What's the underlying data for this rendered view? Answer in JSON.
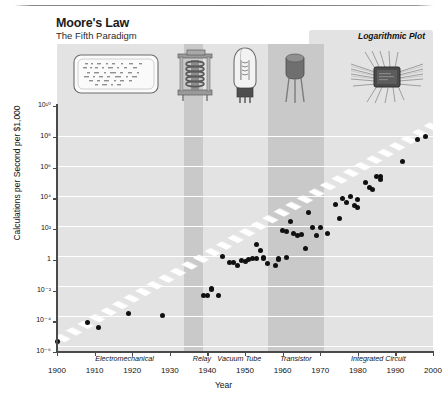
{
  "figure": {
    "title": "Moore's Law",
    "subtitle": "The Fifth Paradigm",
    "plot_type_label": "Logarithmic Plot"
  },
  "artwork": [
    {
      "name": "punch-card-illustration",
      "era": "Electromechanical"
    },
    {
      "name": "relay-illustration",
      "era": "Relay"
    },
    {
      "name": "vacuum-tube-illustration",
      "era": "Vacuum Tube"
    },
    {
      "name": "transistor-illustration",
      "era": "Transistor"
    },
    {
      "name": "integrated-circuit-illustration",
      "era": "Integrated Circuit"
    }
  ],
  "chart_data": {
    "type": "scatter",
    "title": "Moore's Law",
    "subtitle": "The Fifth Paradigm",
    "annotation": "Logarithmic Plot",
    "xlabel": "Year",
    "ylabel": "Calculations per Second per $1,000",
    "xlim": [
      1900,
      2000
    ],
    "ylim": [
      -6,
      10
    ],
    "yscale": "log10",
    "grid": true,
    "legend": "none",
    "xticks": [
      1900,
      1910,
      1920,
      1930,
      1940,
      1950,
      1960,
      1970,
      1980,
      1990,
      2000
    ],
    "xticklabels": [
      "1900",
      "1910",
      "1920",
      "1930",
      "1940",
      "1950",
      "1960",
      "1970",
      "1980",
      "1990",
      "2000"
    ],
    "yticks": [
      -6,
      -4,
      -2,
      0,
      2,
      4,
      6,
      8,
      10
    ],
    "yticklabels": [
      "10⁻⁶",
      "10⁻⁴",
      "10⁻²",
      "1",
      "10²",
      "10⁴",
      "10⁶",
      "10⁸",
      "10¹⁰"
    ],
    "eras": [
      {
        "label": "Electromechanical",
        "start": 1900,
        "end": 1936,
        "shaded": false
      },
      {
        "label": "Relay",
        "start": 1936,
        "end": 1941,
        "shaded": true
      },
      {
        "label": "Vacuum Tube",
        "start": 1941,
        "end": 1956,
        "shaded": false
      },
      {
        "label": "Transistor",
        "start": 1956,
        "end": 1971,
        "shaded": true
      },
      {
        "label": "Integrated Circuit",
        "start": 1971,
        "end": 2000,
        "shaded": false
      }
    ],
    "trendline": {
      "type": "exponential-fit",
      "style": "dashed-white-band",
      "x": [
        1900,
        2000
      ],
      "log10y": [
        -5.3,
        8.7
      ]
    },
    "points": [
      {
        "x": 1900,
        "log10y": -5.3
      },
      {
        "x": 1908,
        "log10y": -4.1
      },
      {
        "x": 1911,
        "log10y": -4.4
      },
      {
        "x": 1919,
        "log10y": -3.5
      },
      {
        "x": 1928,
        "log10y": -3.6
      },
      {
        "x": 1939,
        "log10y": -2.3
      },
      {
        "x": 1940,
        "log10y": -2.35
      },
      {
        "x": 1941,
        "log10y": -1.85
      },
      {
        "x": 1941,
        "log10y": -1.95
      },
      {
        "x": 1943,
        "log10y": -2.3
      },
      {
        "x": 1944,
        "log10y": 0.2
      },
      {
        "x": 1946,
        "log10y": -0.2
      },
      {
        "x": 1947,
        "log10y": -0.2
      },
      {
        "x": 1948,
        "log10y": -0.4
      },
      {
        "x": 1949,
        "log10y": -0.05
      },
      {
        "x": 1950,
        "log10y": -0.1
      },
      {
        "x": 1951,
        "log10y": 0.0
      },
      {
        "x": 1952,
        "log10y": 0.1
      },
      {
        "x": 1953,
        "log10y": 0.05
      },
      {
        "x": 1953,
        "log10y": 1.0
      },
      {
        "x": 1954,
        "log10y": 0.6
      },
      {
        "x": 1955,
        "log10y": 0.15
      },
      {
        "x": 1955,
        "log10y": 0.1
      },
      {
        "x": 1956,
        "log10y": -0.25
      },
      {
        "x": 1958,
        "log10y": -0.35
      },
      {
        "x": 1959,
        "log10y": 0.05
      },
      {
        "x": 1959,
        "log10y": 0.0
      },
      {
        "x": 1960,
        "log10y": 1.9
      },
      {
        "x": 1961,
        "log10y": 1.85
      },
      {
        "x": 1961,
        "log10y": 0.15
      },
      {
        "x": 1962,
        "log10y": 2.5
      },
      {
        "x": 1963,
        "log10y": 1.7
      },
      {
        "x": 1964,
        "log10y": 1.6
      },
      {
        "x": 1965,
        "log10y": 1.65
      },
      {
        "x": 1966,
        "log10y": 0.7
      },
      {
        "x": 1967,
        "log10y": 3.1
      },
      {
        "x": 1968,
        "log10y": 2.1
      },
      {
        "x": 1969,
        "log10y": 1.6
      },
      {
        "x": 1970,
        "log10y": 2.1
      },
      {
        "x": 1972,
        "log10y": 1.7
      },
      {
        "x": 1974,
        "log10y": 3.6
      },
      {
        "x": 1975,
        "log10y": 2.7
      },
      {
        "x": 1976,
        "log10y": 4.0
      },
      {
        "x": 1977,
        "log10y": 3.7
      },
      {
        "x": 1978,
        "log10y": 4.1
      },
      {
        "x": 1979,
        "log10y": 3.5
      },
      {
        "x": 1980,
        "log10y": 3.4
      },
      {
        "x": 1980,
        "log10y": 3.9
      },
      {
        "x": 1982,
        "log10y": 5.0
      },
      {
        "x": 1983,
        "log10y": 4.7
      },
      {
        "x": 1984,
        "log10y": 4.6
      },
      {
        "x": 1985,
        "log10y": 5.4
      },
      {
        "x": 1986,
        "log10y": 5.4
      },
      {
        "x": 1986,
        "log10y": 5.2
      },
      {
        "x": 1992,
        "log10y": 6.4
      },
      {
        "x": 1996,
        "log10y": 7.8
      },
      {
        "x": 1998,
        "log10y": 8.0
      }
    ]
  }
}
